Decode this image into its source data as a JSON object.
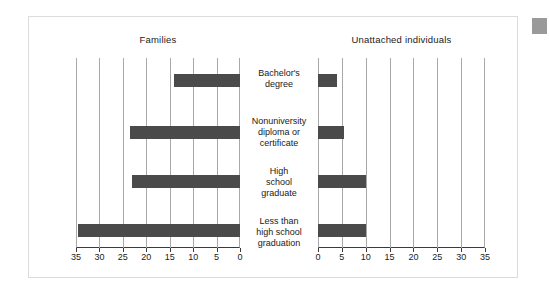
{
  "figure": {
    "left_panel_title": "Families",
    "right_panel_title": "Unattached individuals"
  },
  "categories": [
    "Bachelor's\ndegree",
    "Nonuniversity\ndiploma or\ncertificate",
    "High\nschool\ngraduate",
    "Less than\nhigh school\ngraduation"
  ],
  "axis": {
    "left_ticks": [
      "35",
      "30",
      "25",
      "20",
      "15",
      "10",
      "5",
      "0"
    ],
    "right_ticks": [
      "0",
      "5",
      "10",
      "15",
      "20",
      "25",
      "30",
      "35"
    ]
  },
  "colors": {
    "bar": "#4a4a4a",
    "gridline": "#a8a8a8",
    "axis": "#3a3a3a",
    "frame": "#dcdcdc",
    "corner_marker": "#9a9a9a",
    "background": "#ffffff"
  },
  "chart_data": {
    "type": "bar",
    "title": "",
    "orientation": "horizontal",
    "layout": "back-to-back pyramid, two panels sharing centered category labels",
    "categories": [
      "Bachelor's degree",
      "Nonuniversity diploma or certificate",
      "High school graduate",
      "Less than high school graduation"
    ],
    "series": [
      {
        "name": "Families",
        "panel": "left",
        "axis_direction": "right-to-left",
        "values": [
          14,
          23.5,
          23,
          34.5
        ]
      },
      {
        "name": "Unattached individuals",
        "panel": "right",
        "axis_direction": "left-to-right",
        "values": [
          4,
          5.5,
          10,
          10
        ]
      }
    ],
    "xlabel": "",
    "ylabel": "",
    "xlim_left": [
      35,
      0
    ],
    "xlim_right": [
      0,
      35
    ],
    "xticks_left": [
      35,
      30,
      25,
      20,
      15,
      10,
      5,
      0
    ],
    "xticks_right": [
      0,
      5,
      10,
      15,
      20,
      25,
      30,
      35
    ],
    "grid": true,
    "grid_axis": "x",
    "legend": false
  }
}
